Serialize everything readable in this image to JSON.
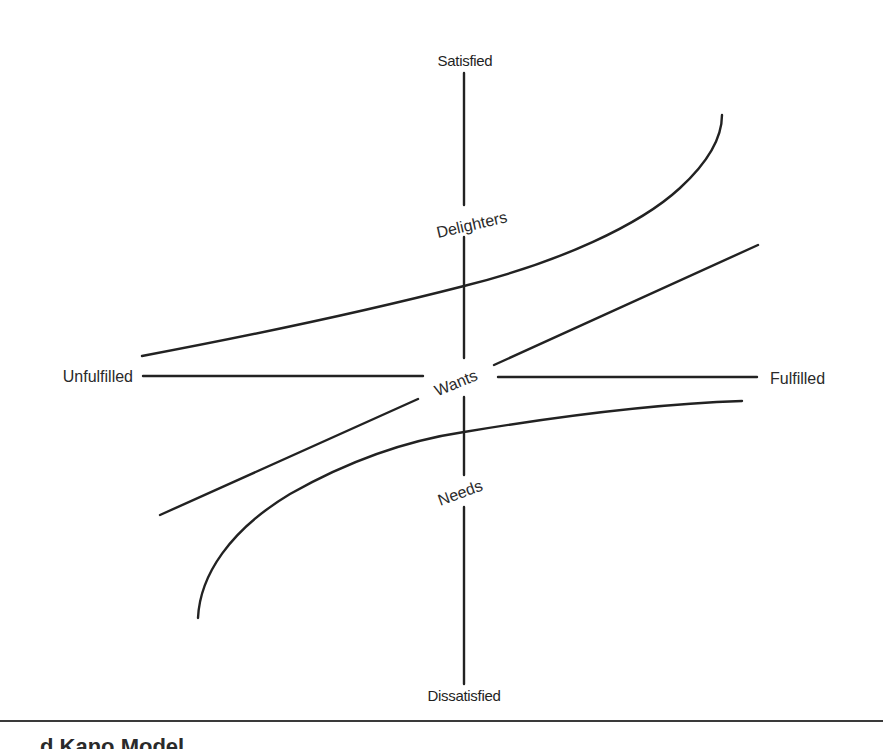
{
  "diagram": {
    "type": "kano-model",
    "axes": {
      "vertical": {
        "top_label": "Satisfied",
        "bottom_label": "Dissatisfied"
      },
      "horizontal": {
        "left_label": "Unfulfilled",
        "right_label": "Fulfilled"
      }
    },
    "curves": [
      {
        "id": "delighters",
        "label": "Delighters",
        "shape": "exponential-up"
      },
      {
        "id": "wants",
        "label": "Wants",
        "shape": "linear"
      },
      {
        "id": "needs",
        "label": "Needs",
        "shape": "logarithmic"
      }
    ],
    "stroke_color": "#222222",
    "background_color": "#ffffff"
  },
  "caption": {
    "text": "d Kano Model"
  }
}
